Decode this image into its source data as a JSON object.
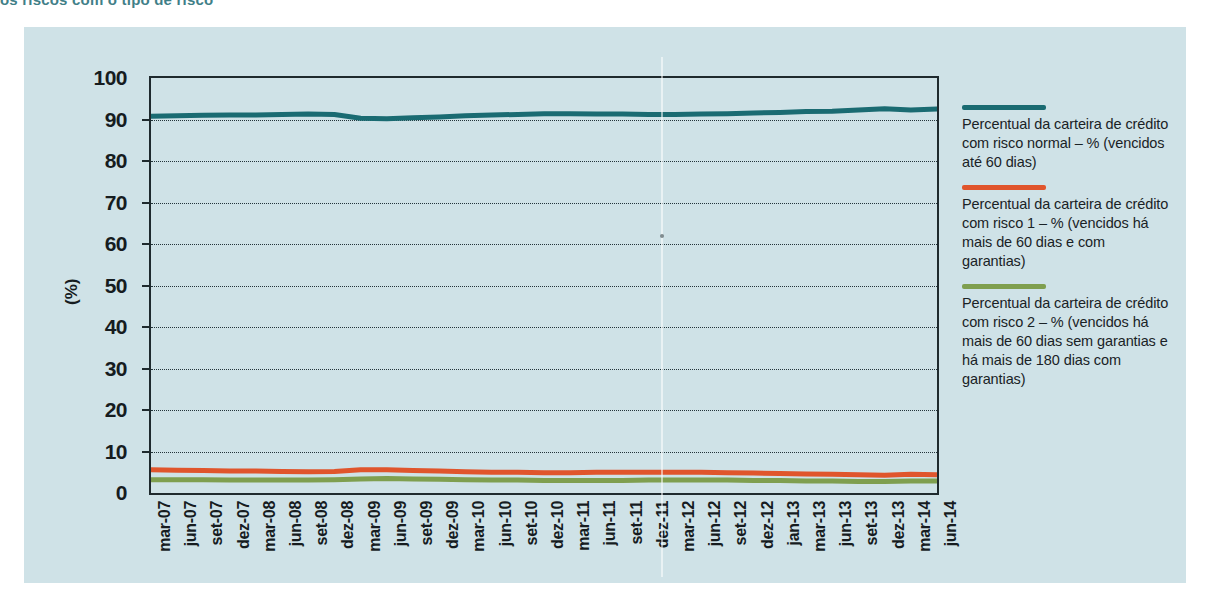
{
  "title": "os riscos com o tipo de risco",
  "colors": {
    "panel_background": "#cfe2e7",
    "series_normal": "#1a6b72",
    "series_risco1": "#e0552c",
    "series_risco2": "#7f9f4f",
    "axis": "#1f2a2e",
    "text": "#161c1f"
  },
  "legend": {
    "entries": [
      {
        "color": "#1a6b72",
        "label": "Percentual da carteira de crédito com risco normal – % (vencidos até 60 dias)"
      },
      {
        "color": "#e0552c",
        "label": "Percentual da carteira de crédito com risco 1 – % (vencidos há mais de 60 dias e com garantias)"
      },
      {
        "color": "#7f9f4f",
        "label": "Percentual da carteira de crédito com risco 2 – % (vencidos há mais de 60 dias sem garantias e há mais de 180 dias com garantias)"
      }
    ]
  },
  "chart_data": {
    "type": "line",
    "title": "",
    "xlabel": "",
    "ylabel": "(%)",
    "ylim": [
      0,
      100
    ],
    "yticks": [
      0,
      10,
      20,
      30,
      40,
      50,
      60,
      70,
      80,
      90,
      100
    ],
    "grid": true,
    "legend_position": "right",
    "categories": [
      "mar-07",
      "jun-07",
      "set-07",
      "dez-07",
      "mar-08",
      "jun-08",
      "set-08",
      "dez-08",
      "mar-09",
      "jun-09",
      "set-09",
      "dez-09",
      "mar-10",
      "jun-10",
      "set-10",
      "dez-10",
      "mar-11",
      "jun-11",
      "set-11",
      "dez-11",
      "mar-12",
      "jun-12",
      "set-12",
      "dez-12",
      "jan-13",
      "mar-13",
      "jun-13",
      "set-13",
      "dez-13",
      "mar-14",
      "jun-14"
    ],
    "series": [
      {
        "name": "Percentual da carteira de crédito com risco normal – % (vencidos até 60 dias)",
        "color": "#1a6b72",
        "values": [
          90.8,
          90.9,
          91.0,
          91.1,
          91.1,
          91.2,
          91.3,
          91.2,
          90.3,
          90.2,
          90.4,
          90.6,
          90.9,
          91.1,
          91.2,
          91.4,
          91.4,
          91.3,
          91.3,
          91.2,
          91.2,
          91.3,
          91.4,
          91.6,
          91.7,
          91.9,
          92.0,
          92.3,
          92.6,
          92.3,
          92.5
        ]
      },
      {
        "name": "Percentual da carteira de crédito com risco 1 – % (vencidos há mais de 60 dias e com garantias)",
        "color": "#e0552c",
        "values": [
          5.6,
          5.5,
          5.4,
          5.3,
          5.3,
          5.2,
          5.1,
          5.2,
          5.6,
          5.6,
          5.4,
          5.3,
          5.1,
          5.0,
          5.0,
          4.9,
          4.9,
          5.0,
          5.0,
          5.0,
          5.0,
          5.0,
          4.9,
          4.8,
          4.7,
          4.6,
          4.5,
          4.4,
          4.3,
          4.5,
          4.4
        ]
      },
      {
        "name": "Percentual da carteira de crédito com risco 2 – % (vencidos há mais de 60 dias sem garantias e há mais de 180 dias com garantias)",
        "color": "#7f9f4f",
        "values": [
          3.2,
          3.2,
          3.2,
          3.1,
          3.1,
          3.1,
          3.1,
          3.2,
          3.4,
          3.5,
          3.4,
          3.3,
          3.2,
          3.1,
          3.1,
          3.0,
          3.0,
          3.0,
          3.0,
          3.1,
          3.1,
          3.1,
          3.1,
          3.0,
          3.0,
          2.9,
          2.9,
          2.8,
          2.8,
          2.9,
          2.9
        ]
      }
    ]
  }
}
